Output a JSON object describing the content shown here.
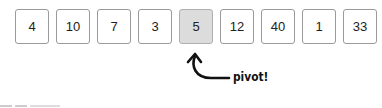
{
  "array": {
    "values": [
      "4",
      "10",
      "7",
      "3",
      "5",
      "12",
      "40",
      "1",
      "33"
    ],
    "pivot_index": 4,
    "cell_color": "#ffffff",
    "pivot_color": "#dcdcdc"
  },
  "annotation": {
    "label": "pivot!",
    "arrow": "curved-arrow-up"
  }
}
